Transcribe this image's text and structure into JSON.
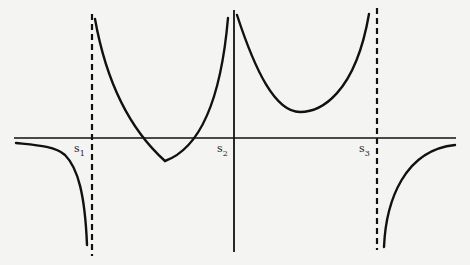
{
  "figure": {
    "type": "function-graph-with-vertical-asymptotes",
    "header_fragment": "",
    "labels": {
      "s1": {
        "base": "s",
        "sub": "1"
      },
      "s2": {
        "base": "s",
        "sub": "2"
      },
      "s3": {
        "base": "s",
        "sub": "3"
      }
    },
    "asymptotes": [
      {
        "name": "s1",
        "style": "dashed"
      },
      {
        "name": "s2",
        "style": "solid"
      },
      {
        "name": "s3",
        "style": "dashed"
      }
    ],
    "branches": [
      {
        "region": "x < s1",
        "behavior": "from 0- descending to -infinity"
      },
      {
        "region": "s1 < x < s2",
        "behavior": "U-shaped, +infinity at both ends, minimum below axis"
      },
      {
        "region": "s2 < x < s3",
        "behavior": "U-shaped, +infinity at both ends, minimum above axis"
      },
      {
        "region": "x > s3",
        "behavior": "from -infinity rising to 0-"
      }
    ],
    "colors": {
      "ink": "#111111",
      "paper": "#f4f4f2"
    }
  }
}
